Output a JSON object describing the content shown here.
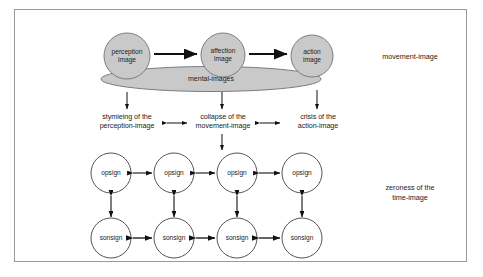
{
  "diagram": {
    "title_area": "Deleuze movement-image / time-image schema",
    "frame": {
      "border_color": "#9a9a9a",
      "background": "#ffffff"
    },
    "colors": {
      "shape_fill": "#c9c9c9",
      "shape_stroke": "#7c7c7c",
      "circle_fill": "#ffffff",
      "circle_stroke": "#555555",
      "arrow": "#111111",
      "text": "#222222"
    },
    "top_row": {
      "nodes": [
        {
          "id": "perception",
          "label": "perception\nimage"
        },
        {
          "id": "affection",
          "label": "affection\nimage"
        },
        {
          "id": "action",
          "label": "action\nimage"
        }
      ],
      "ellipse_label": "mental-images",
      "side_label": "movement-image"
    },
    "middle_labels": [
      {
        "id": "stymieing",
        "label": "stymieing of the\nperception-image"
      },
      {
        "id": "collapse",
        "label": "collapse of the\nmovement-image"
      },
      {
        "id": "crisis",
        "label": "crisis of the\naction-image"
      }
    ],
    "opsign_row": {
      "nodes": [
        {
          "label": "opsign"
        },
        {
          "label": "opsign"
        },
        {
          "label": "opsign"
        },
        {
          "label": "opsign"
        }
      ]
    },
    "sonsign_row": {
      "nodes": [
        {
          "label": "sonsign"
        },
        {
          "label": "sonsign"
        },
        {
          "label": "sonsign"
        },
        {
          "label": "sonsign"
        }
      ]
    },
    "bottom_side_label": "zeroness of the\ntime-image"
  }
}
